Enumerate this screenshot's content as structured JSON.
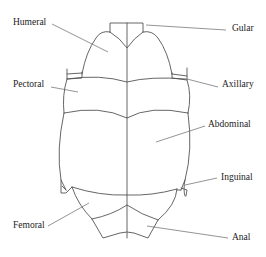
{
  "diagram": {
    "stroke_color": "#555555",
    "label_color": "#222222",
    "labels": [
      {
        "id": "humeral",
        "text": "Humeral",
        "x": 13,
        "y": 18
      },
      {
        "id": "pectoral",
        "text": "Pectoral",
        "x": 13,
        "y": 80
      },
      {
        "id": "femoral",
        "text": "Femoral",
        "x": 13,
        "y": 221
      },
      {
        "id": "gular",
        "text": "Gular",
        "x": 232,
        "y": 24
      },
      {
        "id": "axillary",
        "text": "Axillary",
        "x": 222,
        "y": 79
      },
      {
        "id": "abdominal",
        "text": "Abdominal",
        "x": 209,
        "y": 120
      },
      {
        "id": "inguinal",
        "text": "Inguinal",
        "x": 221,
        "y": 173
      },
      {
        "id": "anal",
        "text": "Anal",
        "x": 232,
        "y": 233
      }
    ]
  }
}
